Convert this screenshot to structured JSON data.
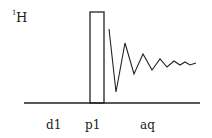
{
  "diagram": {
    "type": "nmr-pulse-sequence",
    "channel": {
      "isotope_mass": "1",
      "element": "H"
    },
    "labels": {
      "delay": "d1",
      "pulse": "p1",
      "acquisition": "aq"
    },
    "colors": {
      "line": "#222222",
      "background": "#ffffff"
    },
    "baseline": {
      "x1": 24,
      "x2": 200,
      "y": 103
    },
    "pulse": {
      "x": 90,
      "y": 12,
      "width": 14,
      "height": 91
    },
    "fid_points": "109,29 116,92 125,43 134,74 143,54 152,70 160,59 167,67 174,61 180,65 185,62 190,65 196,63"
  }
}
